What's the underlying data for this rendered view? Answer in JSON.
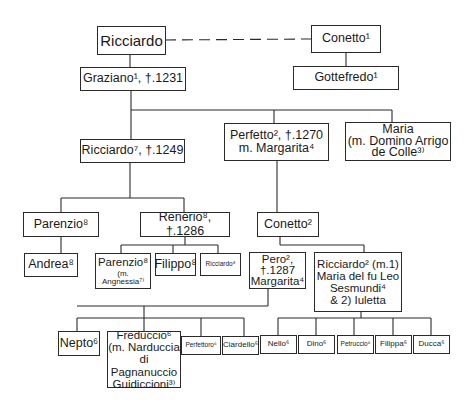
{
  "diagram": {
    "type": "family-tree",
    "nodes": {
      "ricciardo_root": {
        "label": "Ricciardo"
      },
      "conetto1": {
        "label": "Conetto¹"
      },
      "graziano": {
        "label": "Graziano¹, †.1231"
      },
      "gottefredo": {
        "label": "Gottefredo¹"
      },
      "ricciardo7": {
        "label": "Ricciardo⁷, †.1249"
      },
      "perfetto": {
        "label": "Perfetto², †.1270\nm. Margarita⁴"
      },
      "maria": {
        "label": "Maria\n(m. Domino Arrigo\nde Colle³⁾"
      },
      "parenzio8": {
        "label": "Parenzio⁸"
      },
      "renerio": {
        "label": "Renerio⁸, †.1286"
      },
      "conetto2": {
        "label": "Conetto²"
      },
      "andrea": {
        "label": "Andrea⁸"
      },
      "parenzio8b": {
        "label": "Parenzio⁸",
        "sub": "(m. Angnessia⁷⁾"
      },
      "filippo": {
        "label": "Filippo⁸"
      },
      "ricciardo8": {
        "label": "Ricciardo⁸"
      },
      "pero": {
        "label": "Pero²,\n†.1287\nMargarita⁴"
      },
      "ricciardo2": {
        "label": "Ricciardo² (m.1)\nMaria del fu Leo\nSesmundi⁴\n& 2) Iuletta"
      },
      "nepto": {
        "label": "Nepto⁶"
      },
      "freduccio": {
        "label": "Freduccio⁶\n(m. Narduccia\ndi Pagnanuccio\nGuidiccioni³⁾"
      },
      "perfettoro": {
        "label": "Perfettoro⁶"
      },
      "ciardello": {
        "label": "Ciardello⁶"
      },
      "nello": {
        "label": "Nello⁶"
      },
      "dino": {
        "label": "Dino⁶"
      },
      "petruccio": {
        "label": "Petruccio⁶"
      },
      "filippa": {
        "label": "Filippa⁶"
      },
      "ducca": {
        "label": "Ducca⁶"
      }
    },
    "edges": [
      {
        "from": "ricciardo_root",
        "to": "conetto1",
        "style": "dashed"
      },
      {
        "from": "ricciardo_root",
        "to": "graziano"
      },
      {
        "from": "conetto1",
        "to": "gottefredo"
      },
      {
        "from": "graziano",
        "to": "ricciardo7"
      },
      {
        "from": "graziano",
        "to": "perfetto"
      },
      {
        "from": "graziano",
        "to": "maria"
      },
      {
        "from": "ricciardo7",
        "to": "parenzio8"
      },
      {
        "from": "ricciardo7",
        "to": "renerio"
      },
      {
        "from": "perfetto",
        "to": "conetto2"
      },
      {
        "from": "parenzio8",
        "to": "andrea"
      },
      {
        "from": "renerio",
        "to": "parenzio8b"
      },
      {
        "from": "renerio",
        "to": "filippo"
      },
      {
        "from": "renerio",
        "to": "ricciardo8"
      },
      {
        "from": "conetto2",
        "to": "pero"
      },
      {
        "from": "conetto2",
        "to": "ricciardo2"
      },
      {
        "from": "pero",
        "to": "nepto"
      },
      {
        "from": "pero",
        "to": "freduccio"
      },
      {
        "from": "pero",
        "to": "perfettoro"
      },
      {
        "from": "pero",
        "to": "ciardello"
      },
      {
        "from": "ricciardo2",
        "to": "nello"
      },
      {
        "from": "ricciardo2",
        "to": "dino"
      },
      {
        "from": "ricciardo2",
        "to": "petruccio"
      },
      {
        "from": "ricciardo2",
        "to": "filippa"
      },
      {
        "from": "ricciardo2",
        "to": "ducca"
      }
    ]
  },
  "colors": {
    "line": "#2a2a2a",
    "background": "#ffffff",
    "text": "#1a1a1a"
  }
}
